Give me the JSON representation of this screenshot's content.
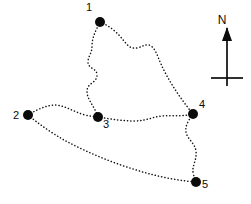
{
  "figure": {
    "type": "sketch-map",
    "background_color": "#ffffff",
    "width": 251,
    "height": 204
  },
  "chart_data": {
    "type": "scatter",
    "title": "",
    "xlabel": "",
    "ylabel": "",
    "grid": false,
    "legend": "none",
    "xlim": [
      0,
      251
    ],
    "ylim": [
      0,
      204
    ],
    "note": "Dotted-line route network connecting five numbered survey points, with a north arrow at upper right.",
    "sites": [
      {
        "label": "1",
        "x": 100,
        "y": 22,
        "label_x": 89,
        "label_y": 11
      },
      {
        "label": "2",
        "x": 28,
        "y": 115,
        "label_x": 16,
        "label_y": 119
      },
      {
        "label": "3",
        "x": 98,
        "y": 117,
        "label_x": 106,
        "label_y": 128
      },
      {
        "label": "4",
        "x": 193,
        "y": 114,
        "label_x": 202,
        "label_y": 108
      },
      {
        "label": "5",
        "x": 196,
        "y": 182,
        "label_x": 205,
        "label_y": 188
      }
    ],
    "edges": [
      {
        "from": "1",
        "to": "3",
        "style": "dotted"
      },
      {
        "from": "1",
        "to": "4",
        "style": "dotted"
      },
      {
        "from": "2",
        "to": "3",
        "style": "dotted"
      },
      {
        "from": "3",
        "to": "4",
        "style": "dotted"
      },
      {
        "from": "2",
        "to": "5",
        "style": "dotted"
      },
      {
        "from": "4",
        "to": "5",
        "style": "dotted"
      }
    ],
    "paths": {
      "one_to_three": "M100,22 C95,32 92,38 92,46 C92,54 88,56 88,62 C88,69 97,68 97,75 C97,83 87,83 87,91 C87,100 94,105 98,117",
      "one_to_four": "M100,22 C110,26 118,33 124,41 C128,46 131,49 137,48 C142,47 145,44 149,45 C155,47 157,55 161,64 C168,80 180,98 193,114",
      "two_to_three": "M28,115 C38,109 47,105 56,105 C66,106 74,112 85,115 C90,116 94,117 98,117",
      "three_to_four": "M98,117 C110,119 122,121 134,121 C146,121 152,117 162,116 C172,115 182,117 193,114",
      "two_to_five": "M28,115 C40,125 52,133 64,140 C90,154 120,166 150,174 C165,178 182,181 196,182",
      "four_to_five": "M193,114 C188,121 185,126 186,132 C187,139 195,143 196,151 C197,160 192,166 193,172 C194,177 195,180 196,182"
    },
    "compass": {
      "label": "N",
      "label_x": 222,
      "label_y": 24,
      "shaft_x": 227,
      "shaft_top_y": 28,
      "shaft_bottom_y": 86,
      "crossbar_y": 78,
      "crossbar_x1": 211,
      "crossbar_x2": 243,
      "arrow_head": "227,27 222,41 232,41"
    }
  }
}
